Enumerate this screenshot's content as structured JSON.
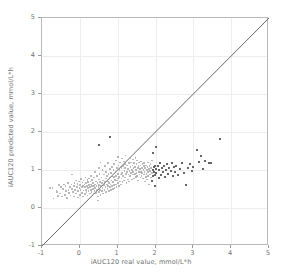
{
  "chart_data": {
    "type": "scatter",
    "title": "",
    "xlabel": "iAUC120 real value, mmol/L*h",
    "ylabel": "iAUC120 predicted value, mmol/L*h",
    "xlim": [
      -1,
      5
    ],
    "ylim": [
      -1,
      5
    ],
    "xticks": [
      -1,
      0,
      1,
      2,
      3,
      4,
      5
    ],
    "yticks": [
      -1,
      0,
      1,
      2,
      3,
      4,
      5
    ],
    "xticklabels": [
      "-1",
      "0",
      "1",
      "2",
      "3",
      "4",
      "5"
    ],
    "yticklabels": [
      "-1",
      "0",
      "1",
      "2",
      "3",
      "4",
      "5"
    ],
    "grid": true,
    "legend": null,
    "annotations": [],
    "reference_line": {
      "name": "identity-line",
      "type": "line",
      "x": [
        -1,
        5
      ],
      "y": [
        -1,
        5
      ],
      "color": "#666666"
    },
    "series": [
      {
        "name": "predictions",
        "marker": "square",
        "color": "#9c9c9c",
        "points": [
          [
            -0.78,
            0.52
          ],
          [
            -0.72,
            0.52
          ],
          [
            -0.7,
            0.25
          ],
          [
            -0.62,
            0.46
          ],
          [
            -0.6,
            0.42
          ],
          [
            -0.58,
            0.32
          ],
          [
            -0.55,
            0.6
          ],
          [
            -0.52,
            0.38
          ],
          [
            -0.5,
            0.55
          ],
          [
            -0.48,
            0.3
          ],
          [
            -0.45,
            0.5
          ],
          [
            -0.42,
            0.62
          ],
          [
            -0.4,
            0.35
          ],
          [
            -0.38,
            0.58
          ],
          [
            -0.36,
            0.45
          ],
          [
            -0.34,
            0.27
          ],
          [
            -0.32,
            0.66
          ],
          [
            -0.3,
            0.48
          ],
          [
            -0.28,
            0.4
          ],
          [
            -0.26,
            0.56
          ],
          [
            -0.25,
            0.33
          ],
          [
            -0.22,
            0.62
          ],
          [
            -0.2,
            0.88
          ],
          [
            -0.2,
            0.5
          ],
          [
            -0.18,
            0.42
          ],
          [
            -0.16,
            0.58
          ],
          [
            -0.15,
            0.3
          ],
          [
            -0.14,
            0.66
          ],
          [
            -0.12,
            0.47
          ],
          [
            -0.1,
            0.72
          ],
          [
            -0.1,
            0.38
          ],
          [
            -0.08,
            0.55
          ],
          [
            -0.06,
            0.63
          ],
          [
            -0.05,
            0.28
          ],
          [
            -0.04,
            0.45
          ],
          [
            -0.02,
            0.7
          ],
          [
            -0.01,
            0.52
          ],
          [
            0.0,
            0.6
          ],
          [
            0.0,
            0.35
          ],
          [
            0.02,
            0.48
          ],
          [
            0.03,
            0.76
          ],
          [
            0.05,
            0.55
          ],
          [
            0.06,
            0.4
          ],
          [
            0.07,
            0.67
          ],
          [
            0.08,
            0.3
          ],
          [
            0.09,
            0.58
          ],
          [
            0.1,
            0.72
          ],
          [
            0.1,
            0.46
          ],
          [
            0.12,
            0.62
          ],
          [
            0.13,
            0.37
          ],
          [
            0.14,
            0.55
          ],
          [
            0.15,
            0.8
          ],
          [
            0.16,
            0.48
          ],
          [
            0.17,
            0.65
          ],
          [
            0.18,
            0.42
          ],
          [
            0.19,
            0.58
          ],
          [
            0.2,
            0.74
          ],
          [
            0.2,
            0.33
          ],
          [
            0.21,
            0.52
          ],
          [
            0.22,
            0.68
          ],
          [
            0.23,
            0.45
          ],
          [
            0.24,
            0.6
          ],
          [
            0.25,
            0.78
          ],
          [
            0.26,
            0.38
          ],
          [
            0.27,
            0.55
          ],
          [
            0.28,
            0.7
          ],
          [
            0.29,
            0.48
          ],
          [
            0.3,
            0.62
          ],
          [
            0.3,
            0.85
          ],
          [
            0.31,
            0.42
          ],
          [
            0.32,
            0.57
          ],
          [
            0.33,
            0.73
          ],
          [
            0.34,
            0.5
          ],
          [
            0.35,
            0.65
          ],
          [
            0.36,
            0.36
          ],
          [
            0.37,
            0.58
          ],
          [
            0.38,
            0.8
          ],
          [
            0.39,
            0.45
          ],
          [
            0.4,
            0.62
          ],
          [
            0.4,
            0.95
          ],
          [
            0.41,
            0.52
          ],
          [
            0.42,
            0.7
          ],
          [
            0.43,
            0.4
          ],
          [
            0.44,
            0.58
          ],
          [
            0.45,
            0.85
          ],
          [
            0.46,
            0.48
          ],
          [
            0.47,
            0.66
          ],
          [
            0.48,
            0.3
          ],
          [
            0.48,
            0.2
          ],
          [
            0.49,
            0.55
          ],
          [
            0.5,
            0.75
          ],
          [
            0.5,
            1.05
          ],
          [
            0.5,
            0.42
          ],
          [
            0.5,
            1.65
          ],
          [
            0.51,
            0.6
          ],
          [
            0.52,
            0.9
          ],
          [
            0.53,
            0.48
          ],
          [
            0.54,
            0.68
          ],
          [
            0.55,
            0.35
          ],
          [
            0.55,
            1.2
          ],
          [
            0.56,
            0.58
          ],
          [
            0.57,
            0.8
          ],
          [
            0.58,
            0.45
          ],
          [
            0.59,
            0.65
          ],
          [
            0.6,
            1.0
          ],
          [
            0.6,
            0.52
          ],
          [
            0.61,
            0.72
          ],
          [
            0.62,
            0.38
          ],
          [
            0.63,
            0.6
          ],
          [
            0.64,
            0.88
          ],
          [
            0.65,
            0.48
          ],
          [
            0.66,
            0.68
          ],
          [
            0.67,
            1.1
          ],
          [
            0.68,
            0.55
          ],
          [
            0.69,
            0.78
          ],
          [
            0.7,
            0.42
          ],
          [
            0.7,
            0.95
          ],
          [
            0.71,
            0.62
          ],
          [
            0.72,
            0.85
          ],
          [
            0.73,
            0.5
          ],
          [
            0.74,
            0.7
          ],
          [
            0.75,
            1.18
          ],
          [
            0.75,
            0.58
          ],
          [
            0.76,
            0.9
          ],
          [
            0.77,
            0.45
          ],
          [
            0.78,
            0.66
          ],
          [
            0.79,
            1.02
          ],
          [
            0.8,
            0.55
          ],
          [
            0.8,
            0.8
          ],
          [
            0.8,
            1.87
          ],
          [
            0.81,
            0.62
          ],
          [
            0.82,
            0.92
          ],
          [
            0.83,
            0.48
          ],
          [
            0.84,
            0.72
          ],
          [
            0.85,
            1.08
          ],
          [
            0.85,
            0.58
          ],
          [
            0.86,
            0.85
          ],
          [
            0.87,
            0.5
          ],
          [
            0.88,
            0.68
          ],
          [
            0.89,
            1.0
          ],
          [
            0.9,
            0.6
          ],
          [
            0.9,
            0.82
          ],
          [
            0.91,
            1.15
          ],
          [
            0.92,
            0.52
          ],
          [
            0.93,
            0.74
          ],
          [
            0.94,
            0.95
          ],
          [
            0.95,
            0.62
          ],
          [
            0.95,
            1.25
          ],
          [
            0.96,
            0.85
          ],
          [
            0.97,
            0.55
          ],
          [
            0.98,
            0.72
          ],
          [
            0.99,
            1.05
          ],
          [
            1.0,
            0.65
          ],
          [
            1.0,
            0.9
          ],
          [
            1.0,
            1.35
          ],
          [
            1.01,
            0.78
          ],
          [
            1.02,
            1.12
          ],
          [
            1.03,
            0.58
          ],
          [
            1.04,
            0.82
          ],
          [
            1.05,
            1.0
          ],
          [
            1.06,
            0.7
          ],
          [
            1.07,
            1.2
          ],
          [
            1.08,
            0.88
          ],
          [
            1.09,
            0.62
          ],
          [
            1.1,
            1.05
          ],
          [
            1.1,
            0.78
          ],
          [
            1.11,
            1.3
          ],
          [
            1.12,
            0.92
          ],
          [
            1.13,
            0.68
          ],
          [
            1.14,
            1.1
          ],
          [
            1.15,
            0.85
          ],
          [
            1.16,
            1.22
          ],
          [
            1.17,
            0.72
          ],
          [
            1.18,
            0.98
          ],
          [
            1.19,
            1.15
          ],
          [
            1.2,
            0.8
          ],
          [
            1.2,
            1.05
          ],
          [
            1.21,
            1.38
          ],
          [
            1.22,
            0.9
          ],
          [
            1.23,
            0.65
          ],
          [
            1.24,
            1.12
          ],
          [
            1.25,
            0.95
          ],
          [
            1.26,
            1.25
          ],
          [
            1.27,
            0.75
          ],
          [
            1.28,
            1.02
          ],
          [
            1.29,
            0.88
          ],
          [
            1.3,
            1.18
          ],
          [
            1.3,
            0.7
          ],
          [
            1.31,
            0.98
          ],
          [
            1.32,
            1.3
          ],
          [
            1.33,
            0.85
          ],
          [
            1.34,
            1.08
          ],
          [
            1.35,
            0.92
          ],
          [
            1.36,
            1.2
          ],
          [
            1.37,
            0.75
          ],
          [
            1.38,
            1.0
          ],
          [
            1.39,
            1.12
          ],
          [
            1.4,
            0.88
          ],
          [
            1.4,
            1.28
          ],
          [
            1.41,
            0.95
          ],
          [
            1.42,
            1.05
          ],
          [
            1.43,
            0.78
          ],
          [
            1.44,
            1.18
          ],
          [
            1.45,
            0.9
          ],
          [
            1.46,
            1.08
          ],
          [
            1.47,
            1.32
          ],
          [
            1.48,
            0.82
          ],
          [
            1.49,
            1.0
          ],
          [
            1.5,
            1.15
          ],
          [
            1.5,
            0.92
          ],
          [
            1.51,
            1.25
          ],
          [
            1.52,
            0.85
          ],
          [
            1.53,
            1.05
          ],
          [
            1.54,
            0.72
          ],
          [
            1.55,
            1.1
          ],
          [
            1.56,
            0.95
          ],
          [
            1.57,
            1.2
          ],
          [
            1.58,
            0.88
          ],
          [
            1.59,
            1.02
          ],
          [
            1.6,
            1.12
          ],
          [
            1.6,
            0.8
          ],
          [
            1.61,
            0.95
          ],
          [
            1.62,
            1.22
          ],
          [
            1.63,
            0.85
          ],
          [
            1.64,
            1.05
          ],
          [
            1.65,
            0.92
          ],
          [
            1.66,
            1.15
          ],
          [
            1.67,
            0.78
          ],
          [
            1.68,
            1.0
          ],
          [
            1.69,
            1.1
          ],
          [
            1.7,
            0.88
          ],
          [
            1.7,
            1.18
          ],
          [
            1.71,
            0.95
          ],
          [
            1.72,
            0.7
          ],
          [
            1.73,
            1.05
          ],
          [
            1.74,
            0.82
          ],
          [
            1.75,
            1.12
          ],
          [
            1.76,
            0.9
          ],
          [
            1.77,
            1.0
          ],
          [
            1.78,
            0.75
          ],
          [
            1.79,
            1.08
          ],
          [
            1.8,
            0.95
          ],
          [
            1.8,
            1.2
          ],
          [
            1.81,
            0.85
          ],
          [
            1.82,
            1.02
          ],
          [
            1.83,
            0.62
          ],
          [
            1.84,
            1.1
          ],
          [
            1.85,
            0.88
          ],
          [
            1.86,
            0.98
          ],
          [
            1.87,
            1.15
          ],
          [
            1.88,
            0.8
          ],
          [
            1.89,
            1.05
          ],
          [
            1.9,
            0.92
          ],
          [
            1.9,
            1.25
          ],
          [
            1.91,
            0.72
          ],
          [
            1.92,
            1.0
          ],
          [
            1.93,
            0.85
          ],
          [
            1.94,
            1.45
          ],
          [
            1.95,
            1.08
          ],
          [
            1.96,
            0.95
          ],
          [
            1.97,
            0.58
          ],
          [
            1.98,
            1.12
          ],
          [
            1.99,
            0.88
          ],
          [
            2.0,
            1.02
          ],
          [
            2.0,
            1.62
          ],
          [
            2.02,
            0.92
          ],
          [
            2.05,
            1.1
          ],
          [
            2.08,
            0.8
          ],
          [
            2.1,
            1.0
          ],
          [
            2.12,
            1.2
          ],
          [
            2.15,
            0.88
          ],
          [
            2.18,
            1.05
          ],
          [
            2.2,
            0.95
          ],
          [
            2.22,
            1.12
          ],
          [
            2.25,
            0.82
          ],
          [
            2.28,
            1.0
          ],
          [
            2.3,
            1.15
          ],
          [
            2.33,
            0.9
          ],
          [
            2.36,
            1.05
          ],
          [
            2.4,
            0.98
          ],
          [
            2.42,
            1.2
          ],
          [
            2.45,
            0.85
          ],
          [
            2.48,
            1.08
          ],
          [
            2.5,
            0.95
          ],
          [
            2.55,
            1.12
          ],
          [
            2.6,
            0.88
          ],
          [
            2.65,
            1.02
          ],
          [
            2.7,
            1.18
          ],
          [
            2.75,
            0.92
          ],
          [
            2.8,
            0.62
          ],
          [
            2.85,
            1.05
          ],
          [
            2.9,
            1.15
          ],
          [
            2.95,
            0.98
          ],
          [
            3.0,
            1.08
          ],
          [
            3.1,
            1.52
          ],
          [
            3.15,
            1.22
          ],
          [
            3.2,
            1.38
          ],
          [
            3.25,
            1.02
          ],
          [
            3.3,
            1.25
          ],
          [
            3.4,
            1.2
          ],
          [
            3.45,
            1.18
          ],
          [
            3.7,
            1.82
          ]
        ]
      }
    ]
  },
  "axis": {
    "x_title": "iAUC120 real value, mmol/L*h",
    "y_title": "iAUC120 predicted value, mmol/L*h"
  }
}
